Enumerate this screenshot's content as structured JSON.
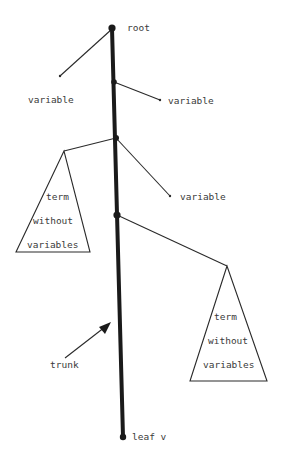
{
  "diagram": {
    "colors": {
      "ink": "#1a1a1a",
      "text": "#3a3a3a",
      "background": "#ffffff"
    },
    "labels": {
      "root": "root",
      "variable_1": "variable",
      "variable_2": "variable",
      "variable_3": "variable",
      "left_term": [
        "term",
        "without",
        "variables"
      ],
      "right_term": [
        "term",
        "without",
        "variables"
      ],
      "trunk": "trunk",
      "leaf": "leaf v"
    },
    "nodes": [
      {
        "id": "root",
        "x": 112,
        "y": 28
      },
      {
        "id": "n2",
        "x": 114,
        "y": 82
      },
      {
        "id": "n3",
        "x": 116,
        "y": 138
      },
      {
        "id": "n4",
        "x": 117,
        "y": 215
      },
      {
        "id": "leaf",
        "x": 123,
        "y": 437
      }
    ]
  }
}
